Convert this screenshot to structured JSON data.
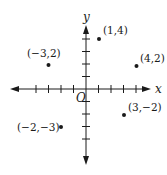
{
  "diagram": {
    "type": "coordinate-plane",
    "axes": {
      "x_label": "x",
      "y_label": "y",
      "origin_label": "O",
      "x_ticks": [
        -4,
        -3,
        -2,
        -1,
        1,
        2,
        3,
        4
      ],
      "y_ticks": [
        -4,
        -3,
        -2,
        -1,
        1,
        2,
        3,
        4
      ]
    },
    "points": [
      {
        "label": "(1,4)",
        "x": 1,
        "y": 4
      },
      {
        "label": "(−3,2)",
        "x": -3,
        "y": 2
      },
      {
        "label": "(4,2)",
        "x": 4,
        "y": 2
      },
      {
        "label": "(3,−2)",
        "x": 3,
        "y": -2
      },
      {
        "label": "(−2,−3)",
        "x": -2,
        "y": -3
      }
    ],
    "colors": {
      "ink": "#1a1a1a",
      "background": "#ffffff"
    }
  }
}
